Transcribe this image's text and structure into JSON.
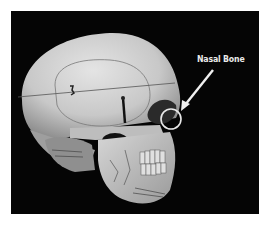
{
  "figure": {
    "annotation": {
      "label": "Nasal Bone",
      "arrow": {
        "from": [
          213,
          70
        ],
        "to": [
          183,
          108
        ]
      },
      "circle": {
        "center": [
          171,
          119
        ],
        "radius": 10
      }
    },
    "colors": {
      "background": "#ffffff",
      "frame": "#050505",
      "bone": "#cfcfcf",
      "annotation": "#eaeaea"
    }
  }
}
